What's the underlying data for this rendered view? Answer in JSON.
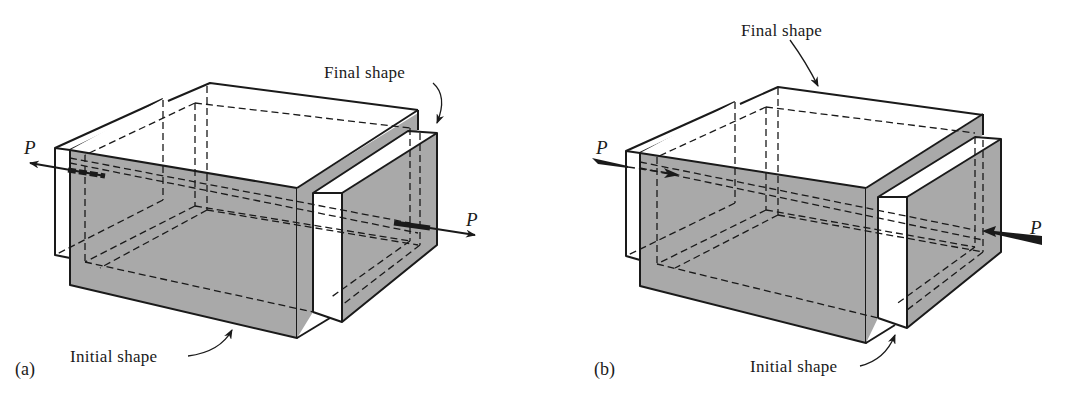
{
  "figure": {
    "panels": [
      {
        "id": "a",
        "sub_label": "(a)",
        "label_final": "Final shape",
        "label_initial": "Initial shape",
        "force_label_left": "P",
        "force_label_right": "P",
        "load_type": "tension"
      },
      {
        "id": "b",
        "sub_label": "(b)",
        "label_final": "Final shape",
        "label_initial": "Initial shape",
        "force_label_left": "P",
        "force_label_right": "P",
        "load_type": "compression"
      }
    ],
    "colors": {
      "shade": "#a9a9a9",
      "line": "#1a1a1a",
      "background": "#ffffff"
    }
  }
}
